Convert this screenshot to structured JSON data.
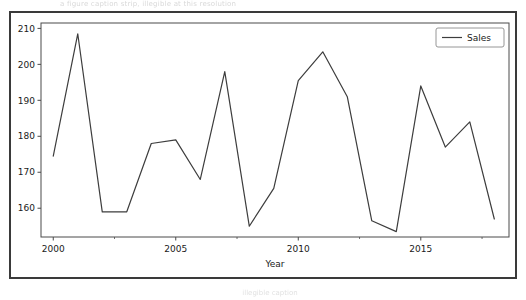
{
  "figure": {
    "top_faint_text": "a figure caption strip, illegible at this resolution",
    "bottom_faint_text": "illegible caption",
    "background_color": "#ffffff",
    "frame_color": "#3a3a3a"
  },
  "legend": {
    "position": "upper-right",
    "entries": [
      {
        "label": "Sales",
        "color": "#3d3d3d"
      }
    ]
  },
  "chart_data": {
    "type": "line",
    "title": "",
    "xlabel": "Year",
    "ylabel": "",
    "xlim": [
      1999.5,
      2018.6
    ],
    "ylim": [
      152.0,
      211.5
    ],
    "grid": false,
    "legend_position": "upper right",
    "xticks": [
      2000,
      2005,
      2010,
      2015
    ],
    "xtick_labels": [
      "2000",
      "2005",
      "2010",
      "2015"
    ],
    "xticks_minor": [
      2002.5,
      2007.5,
      2012.5,
      2017.5
    ],
    "yticks": [
      160,
      170,
      180,
      190,
      200,
      210
    ],
    "ytick_labels": [
      "160",
      "170",
      "180",
      "190",
      "200",
      "210"
    ],
    "line_color": "#3d3d3d",
    "line_width": 1.2,
    "x": [
      2000,
      2001,
      2002,
      2003,
      2004,
      2005,
      2006,
      2007,
      2008,
      2009,
      2010,
      2011,
      2012,
      2013,
      2014,
      2015,
      2016,
      2017,
      2018
    ],
    "series": [
      {
        "name": "Sales",
        "color": "#3d3d3d",
        "values": [
          174.5,
          208.5,
          159.0,
          159.0,
          178.0,
          179.0,
          168.0,
          198.0,
          155.0,
          165.5,
          195.5,
          203.5,
          191.0,
          156.5,
          153.5,
          194.0,
          177.0,
          184.0,
          157.0
        ]
      }
    ]
  }
}
